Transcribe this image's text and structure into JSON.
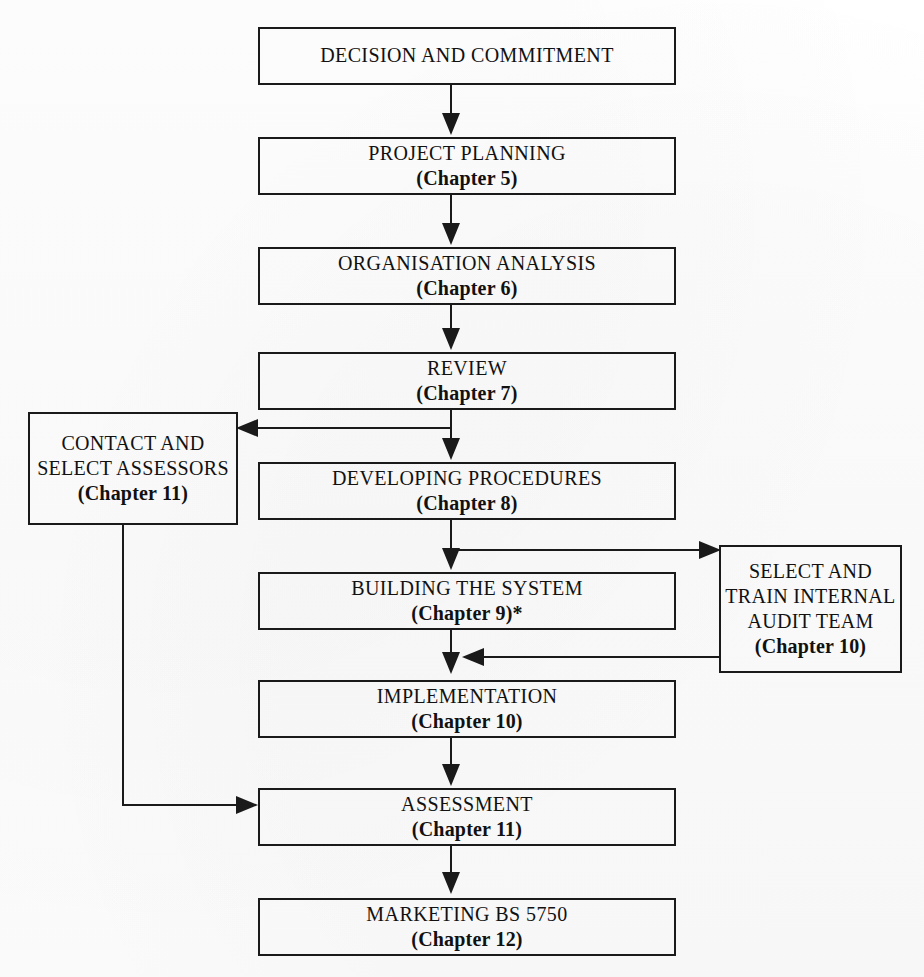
{
  "diagram": {
    "type": "flowchart",
    "orientation": "vertical",
    "background_color": "#fdfdfd",
    "line_color": "#1a1a1a",
    "nodes": [
      {
        "id": "decision",
        "title": "DECISION AND COMMITMENT",
        "chapter": "",
        "x": 258,
        "y": 27,
        "w": 418,
        "h": 58
      },
      {
        "id": "project-planning",
        "title": "PROJECT PLANNING",
        "chapter": "(Chapter 5)",
        "x": 258,
        "y": 137,
        "w": 418,
        "h": 58
      },
      {
        "id": "organisation-analysis",
        "title": "ORGANISATION ANALYSIS",
        "chapter": "(Chapter 6)",
        "x": 258,
        "y": 247,
        "w": 418,
        "h": 58
      },
      {
        "id": "review",
        "title": "REVIEW",
        "chapter": "(Chapter 7)",
        "x": 258,
        "y": 352,
        "w": 418,
        "h": 58
      },
      {
        "id": "contact-select-assessors",
        "title_lines": [
          "CONTACT AND",
          "SELECT ASSESSORS"
        ],
        "chapter": "(Chapter 11)",
        "x": 28,
        "y": 412,
        "w": 210,
        "h": 113
      },
      {
        "id": "developing-procedures",
        "title": "DEVELOPING PROCEDURES",
        "chapter": "(Chapter 8)",
        "x": 258,
        "y": 462,
        "w": 418,
        "h": 58
      },
      {
        "id": "building-the-system",
        "title": "BUILDING THE SYSTEM",
        "chapter": "(Chapter 9)",
        "chapter_suffix": "*",
        "x": 258,
        "y": 572,
        "w": 418,
        "h": 58
      },
      {
        "id": "select-train-internal-audit-team",
        "title_lines": [
          "SELECT AND",
          "TRAIN INTERNAL",
          "AUDIT TEAM"
        ],
        "chapter": "(Chapter 10)",
        "x": 719,
        "y": 545,
        "w": 183,
        "h": 128
      },
      {
        "id": "implementation",
        "title": "IMPLEMENTATION",
        "chapter": "(Chapter 10)",
        "x": 258,
        "y": 680,
        "w": 418,
        "h": 58
      },
      {
        "id": "assessment",
        "title": "ASSESSMENT",
        "chapter": "(Chapter 11)",
        "x": 258,
        "y": 788,
        "w": 418,
        "h": 58
      },
      {
        "id": "marketing-bs-5750",
        "title": "MARKETING BS 5750",
        "chapter": "(Chapter 12)",
        "x": 258,
        "y": 898,
        "w": 418,
        "h": 58
      }
    ],
    "edges": [
      {
        "from": "decision",
        "to": "project-planning",
        "direction": "down"
      },
      {
        "from": "project-planning",
        "to": "organisation-analysis",
        "direction": "down"
      },
      {
        "from": "organisation-analysis",
        "to": "review",
        "direction": "down"
      },
      {
        "from": "review",
        "to": "developing-procedures",
        "direction": "down"
      },
      {
        "from": "review",
        "to": "contact-select-assessors",
        "direction": "left"
      },
      {
        "from": "developing-procedures",
        "to": "building-the-system",
        "direction": "down"
      },
      {
        "from": "developing-procedures",
        "to": "select-train-internal-audit-team",
        "direction": "right"
      },
      {
        "from": "building-the-system",
        "to": "implementation",
        "direction": "down"
      },
      {
        "from": "select-train-internal-audit-team",
        "to": "implementation",
        "direction": "left"
      },
      {
        "from": "implementation",
        "to": "assessment",
        "direction": "down"
      },
      {
        "from": "contact-select-assessors",
        "to": "assessment",
        "direction": "down-right"
      },
      {
        "from": "assessment",
        "to": "marketing-bs-5750",
        "direction": "down"
      }
    ]
  }
}
